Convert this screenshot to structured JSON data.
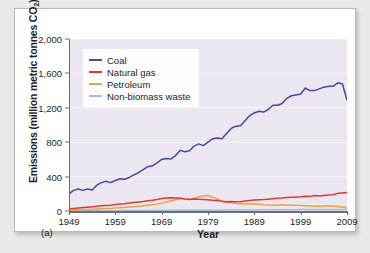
{
  "figure": {
    "panel_id": "(a)",
    "background": "#e9e9e9",
    "card_background": "#ffffff"
  },
  "chart_data": {
    "type": "line",
    "title": "",
    "xlabel": "Year",
    "ylabel": "Emissions (million metric tonnes CO2)",
    "ylabel_main": "Emissions (million metric tonnes CO",
    "ylabel_sub": "2",
    "ylabel_close": ")",
    "xlim": [
      1949,
      2009
    ],
    "ylim": [
      0,
      2000
    ],
    "xticks": [
      1949,
      1959,
      1969,
      1979,
      1989,
      1999,
      2009
    ],
    "yticks": [
      0,
      400,
      800,
      1200,
      1600,
      2000
    ],
    "ytick_labels": [
      "0",
      "400",
      "800",
      "1,200",
      "1,600",
      "2,000"
    ],
    "grid": "horizontal-white-faint",
    "plot_background": "#ece6f0",
    "legend_position": "top-left-inside",
    "x": [
      1949,
      1950,
      1951,
      1952,
      1953,
      1954,
      1955,
      1956,
      1957,
      1958,
      1959,
      1960,
      1961,
      1962,
      1963,
      1964,
      1965,
      1966,
      1967,
      1968,
      1969,
      1970,
      1971,
      1972,
      1973,
      1974,
      1975,
      1976,
      1977,
      1978,
      1979,
      1980,
      1981,
      1982,
      1983,
      1984,
      1985,
      1986,
      1987,
      1988,
      1989,
      1990,
      1991,
      1992,
      1993,
      1994,
      1995,
      1996,
      1997,
      1998,
      1999,
      2000,
      2001,
      2002,
      2003,
      2004,
      2005,
      2006,
      2007,
      2008,
      2009
    ],
    "series": [
      {
        "name": "Coal",
        "color": "#4a4a97",
        "values": [
          200,
          240,
          255,
          240,
          255,
          245,
          300,
          330,
          345,
          330,
          355,
          375,
          370,
          390,
          420,
          445,
          480,
          515,
          525,
          560,
          600,
          610,
          605,
          645,
          705,
          690,
          700,
          755,
          780,
          760,
          800,
          840,
          850,
          840,
          900,
          960,
          985,
          990,
          1050,
          1110,
          1140,
          1160,
          1150,
          1180,
          1230,
          1230,
          1250,
          1310,
          1340,
          1350,
          1360,
          1430,
          1400,
          1400,
          1420,
          1440,
          1450,
          1450,
          1490,
          1480,
          1290
        ]
      },
      {
        "name": "Natural gas",
        "color": "#e03a2f",
        "values": [
          25,
          30,
          35,
          40,
          45,
          48,
          55,
          60,
          65,
          68,
          75,
          80,
          85,
          92,
          98,
          105,
          110,
          118,
          125,
          135,
          145,
          152,
          155,
          152,
          148,
          140,
          135,
          140,
          138,
          135,
          132,
          125,
          122,
          112,
          108,
          110,
          108,
          108,
          115,
          122,
          128,
          132,
          133,
          138,
          142,
          148,
          152,
          158,
          160,
          160,
          165,
          172,
          170,
          180,
          175,
          180,
          185,
          190,
          205,
          210,
          215
        ]
      },
      {
        "name": "Petroleum",
        "color": "#e8a44a",
        "values": [
          10,
          12,
          14,
          16,
          18,
          20,
          23,
          26,
          28,
          30,
          34,
          38,
          42,
          46,
          50,
          55,
          60,
          66,
          72,
          80,
          90,
          105,
          118,
          130,
          148,
          140,
          135,
          150,
          165,
          175,
          180,
          160,
          140,
          115,
          100,
          98,
          88,
          85,
          80,
          82,
          85,
          78,
          72,
          70,
          68,
          70,
          72,
          70,
          68,
          66,
          65,
          62,
          58,
          56,
          55,
          58,
          58,
          56,
          52,
          46,
          38
        ]
      },
      {
        "name": "Non-biomass waste",
        "color": "#a8bdd1",
        "values": [
          2,
          2,
          2,
          3,
          3,
          3,
          3,
          4,
          4,
          4,
          4,
          5,
          5,
          5,
          5,
          6,
          6,
          6,
          6,
          7,
          7,
          7,
          8,
          8,
          8,
          8,
          9,
          9,
          9,
          10,
          10,
          10,
          10,
          11,
          11,
          11,
          12,
          12,
          12,
          13,
          13,
          13,
          14,
          14,
          14,
          14,
          15,
          15,
          15,
          15,
          16,
          16,
          16,
          16,
          16,
          17,
          17,
          17,
          17,
          17,
          17
        ]
      }
    ]
  }
}
